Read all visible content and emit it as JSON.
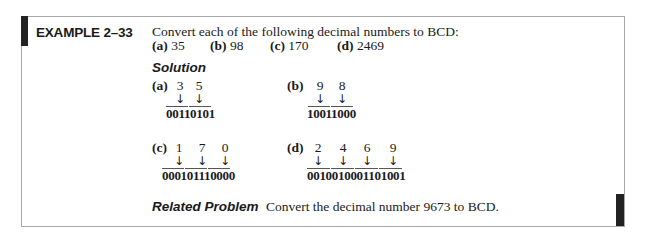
{
  "example": {
    "label": "EXAMPLE 2–33",
    "intro": "Convert each of the following decimal numbers to BCD:",
    "parts": [
      {
        "label": "(a)",
        "value": "35"
      },
      {
        "label": "(b)",
        "value": "98"
      },
      {
        "label": "(c)",
        "value": "170"
      },
      {
        "label": "(d)",
        "value": "2469"
      }
    ]
  },
  "solution": {
    "heading": "Solution",
    "arrow": "↓",
    "items": [
      {
        "label": "(a)",
        "digits": [
          "3",
          "5"
        ],
        "bcd": "00110101"
      },
      {
        "label": "(b)",
        "digits": [
          "9",
          "8"
        ],
        "bcd": "10011000"
      },
      {
        "label": "(c)",
        "digits": [
          "1",
          "7",
          "0"
        ],
        "bcd": "000101110000"
      },
      {
        "label": "(d)",
        "digits": [
          "2",
          "4",
          "6",
          "9"
        ],
        "bcd": "0010010001101001"
      }
    ]
  },
  "related_problem": {
    "label": "Related Problem",
    "text": "Convert the decimal number 9673 to BCD."
  },
  "colors": {
    "border": "#a8a8a8",
    "accent_bar": "#222222",
    "text": "#1a1a1a"
  }
}
